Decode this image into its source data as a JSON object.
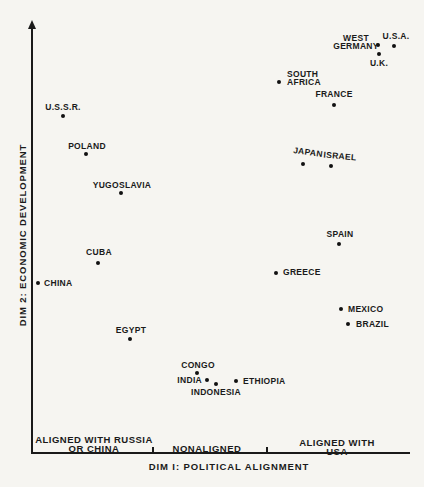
{
  "figure": {
    "background_color": "#f6f5f1",
    "ink_color": "#1a1a1a"
  },
  "chart_data": {
    "type": "scatter",
    "title": "",
    "xlabel": "DIM I: POLITICAL ALIGNMENT",
    "ylabel": "DIM 2: ECONOMIC DEVELOPMENT",
    "grid": false,
    "legend": false,
    "coordinate_system": "pixel (424x487 canvas); axes are unscaled MDS dimensions",
    "axes": {
      "y_axis": {
        "x": 32,
        "top": 20,
        "bottom": 454,
        "arrow": "up"
      },
      "x_axis": {
        "y": 453,
        "left": 32,
        "right": 410
      },
      "x_ticks": [
        153,
        267
      ]
    },
    "x_axis_regions": [
      {
        "text": "ALIGNED WITH RUSSIA\nOR CHINA",
        "cx": 94,
        "cy": 444
      },
      {
        "text": "NONALIGNED",
        "cx": 207,
        "cy": 448
      },
      {
        "text": "ALIGNED WITH USA",
        "cx": 337,
        "cy": 447
      }
    ],
    "points": [
      {
        "label": "U.S.S.R.",
        "x": 63,
        "y": 116,
        "lx": 63,
        "ly": 107,
        "anchor": "center"
      },
      {
        "label": "POLAND",
        "x": 86,
        "y": 154,
        "lx": 87,
        "ly": 146,
        "anchor": "center"
      },
      {
        "label": "YUGOSLAVIA",
        "x": 121,
        "y": 193,
        "lx": 122,
        "ly": 185,
        "anchor": "center"
      },
      {
        "label": "CUBA",
        "x": 98,
        "y": 263,
        "lx": 99,
        "ly": 252,
        "anchor": "center"
      },
      {
        "label": "CHINA",
        "x": 38,
        "y": 283,
        "lx": 44,
        "ly": 283,
        "anchor": "left"
      },
      {
        "label": "EGYPT",
        "x": 130,
        "y": 339,
        "lx": 131,
        "ly": 330,
        "anchor": "center"
      },
      {
        "label": "CONGO",
        "x": 197,
        "y": 373,
        "lx": 198,
        "ly": 365,
        "anchor": "center"
      },
      {
        "label": "INDIA",
        "x": 207,
        "y": 380,
        "lx": 202,
        "ly": 380,
        "anchor": "right"
      },
      {
        "label": "INDONESIA",
        "x": 216,
        "y": 384,
        "lx": 216,
        "ly": 392,
        "anchor": "center"
      },
      {
        "label": "ETHIOPIA",
        "x": 236,
        "y": 381,
        "lx": 243,
        "ly": 381,
        "anchor": "left"
      },
      {
        "label": "GREECE",
        "x": 276,
        "y": 273,
        "lx": 283,
        "ly": 272,
        "anchor": "left"
      },
      {
        "label": "SPAIN",
        "x": 339,
        "y": 244,
        "lx": 340,
        "ly": 234,
        "anchor": "center"
      },
      {
        "label": "MEXICO",
        "x": 341,
        "y": 309,
        "lx": 348,
        "ly": 309,
        "anchor": "left"
      },
      {
        "label": "BRAZIL",
        "x": 348,
        "y": 324,
        "lx": 356,
        "ly": 324,
        "anchor": "left"
      },
      {
        "label": "JAPAN",
        "x": 303,
        "y": 164,
        "lx": 308,
        "ly": 152,
        "anchor": "center",
        "rotate": 8
      },
      {
        "label": "ISRAEL",
        "x": 331,
        "y": 166,
        "lx": 340,
        "ly": 156,
        "anchor": "center",
        "rotate": 5
      },
      {
        "label": "FRANCE",
        "x": 334,
        "y": 105,
        "lx": 334,
        "ly": 94,
        "anchor": "center"
      },
      {
        "label": "SOUTH\nAFRICA",
        "x": 279,
        "y": 82,
        "lx": 287,
        "ly": 78,
        "anchor": "left"
      },
      {
        "label": "WEST\nGERMANY",
        "x": 378,
        "y": 45,
        "lx": 356,
        "ly": 42,
        "anchor": "center"
      },
      {
        "label": "U.S.A.",
        "x": 394,
        "y": 46,
        "lx": 396,
        "ly": 36,
        "anchor": "center"
      },
      {
        "label": "U.K.",
        "x": 379,
        "y": 54,
        "lx": 379,
        "ly": 63,
        "anchor": "center"
      }
    ]
  }
}
